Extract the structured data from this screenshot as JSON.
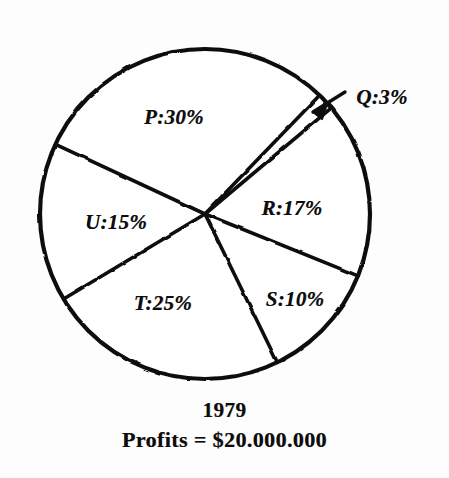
{
  "figure": {
    "kind": "hand-drawn pie chart",
    "background_color": "#fdfdfd",
    "ink_color": "#111111"
  },
  "caption": {
    "year": "1979",
    "profits": "Profits = $20.000.000"
  },
  "callout": {
    "label": "Q:3%",
    "arrow_name": "q-callout-arrow"
  },
  "chart_data": {
    "type": "pie",
    "title": "1979",
    "subtitle": "Profits = $20.000.000",
    "xlabel": "",
    "ylabel": "",
    "units": "percent",
    "total_label": "Profits = $20.000.000",
    "total_value": 20000000,
    "currency": "$",
    "legend": "none (labels drawn inside slices)",
    "grid": false,
    "start_angle_deg": 295,
    "direction": "clockwise",
    "center_px": [
      205,
      214
    ],
    "radius_px": 165,
    "categories": [
      "P",
      "Q",
      "R",
      "S",
      "T",
      "U"
    ],
    "values": [
      30,
      3,
      17,
      10,
      25,
      15
    ],
    "labels": [
      "P:30%",
      "Q:3%",
      "R:17%",
      "S:10%",
      "T:25%",
      "U:15%"
    ],
    "slices": [
      {
        "name": "P",
        "label": "P:30%",
        "value": 30,
        "start_angle_deg": 295,
        "end_angle_deg": 44,
        "label_pos_px": [
          174,
          117
        ],
        "label_inside": true
      },
      {
        "name": "Q",
        "label": "Q:3%",
        "value": 3,
        "start_angle_deg": 44,
        "end_angle_deg": 50,
        "label_pos_px": [
          382,
          97
        ],
        "label_inside": false,
        "callout": true
      },
      {
        "name": "R",
        "label": "R:17%",
        "value": 17,
        "start_angle_deg": 50,
        "end_angle_deg": 112,
        "label_pos_px": [
          292,
          208
        ],
        "label_inside": true
      },
      {
        "name": "S",
        "label": "S:10%",
        "value": 10,
        "start_angle_deg": 112,
        "end_angle_deg": 154,
        "label_pos_px": [
          295,
          299
        ],
        "label_inside": true
      },
      {
        "name": "T",
        "label": "T:25%",
        "value": 25,
        "start_angle_deg": 154,
        "end_angle_deg": 239,
        "label_pos_px": [
          163,
          303
        ],
        "label_inside": true
      },
      {
        "name": "U",
        "label": "U:15%",
        "value": 15,
        "start_angle_deg": 239,
        "end_angle_deg": 295,
        "label_pos_px": [
          116,
          222
        ],
        "label_inside": true
      }
    ]
  }
}
